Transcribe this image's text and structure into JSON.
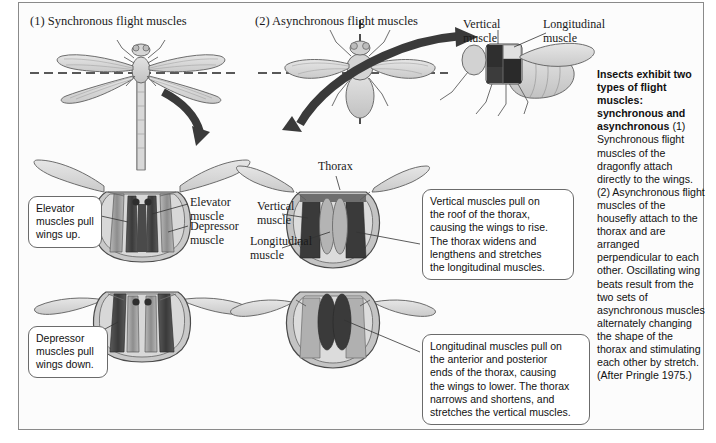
{
  "figure": {
    "panels": [
      {
        "number": "(1)",
        "title": "(1)  Synchronous flight muscles"
      },
      {
        "number": "(2)",
        "title": "(2)  Asynchronous flight muscles"
      }
    ]
  },
  "labels": {
    "elevator_muscle": "Elevator\nmuscle",
    "depressor_muscle": "Depressor\nmuscle",
    "thorax": "Thorax",
    "vertical_muscle_mid": "Vertical\nmuscle",
    "longitudinal_muscle_mid": "Longitudinal\nmuscle",
    "vertical_muscle_fly": "Vertical\nmuscle",
    "longitudinal_muscle_fly": "Longitudinal\nmuscle"
  },
  "callouts": {
    "elevator": "Elevator\nmuscles pull\nwings up.",
    "depressor": "Depressor\nmuscles pull\nwings down.",
    "vertical": "Vertical muscles pull on\nthe roof of the thorax,\ncausing the wings to rise.\nThe thorax widens and\nlengthens and stretches\nthe longitudinal muscles.",
    "longitudinal": "Longitudinal muscles pull on\nthe anterior and posterior\nends of the thorax, causing\nthe wings to lower. The thorax\nnarrows and shortens, and\nstretches the vertical muscles."
  },
  "caption": {
    "heading": "Insects exhibit two types of flight muscles: synchronous and asynchronous",
    "body": "(1) Synchronous flight muscles of the dragonfly attach directly to the wings. (2) Asynchronous flight muscles of the housefly attach to the thorax and are arranged perpendicular to each other. Oscillating wing beats result from the two sets of asynchronous muscles alternately changing the shape of the thorax and stimulating each other by stretch. (After Pringle 1975.)"
  },
  "colors": {
    "muscle_dark": "#3f3f3f",
    "muscle_mid": "#8d8d8d",
    "body_light": "#cfcfcf",
    "wing": "#d9d9d9",
    "outline": "#4a4a4a",
    "arrow": "#3a3a3a",
    "border": "#8a8a8a"
  }
}
